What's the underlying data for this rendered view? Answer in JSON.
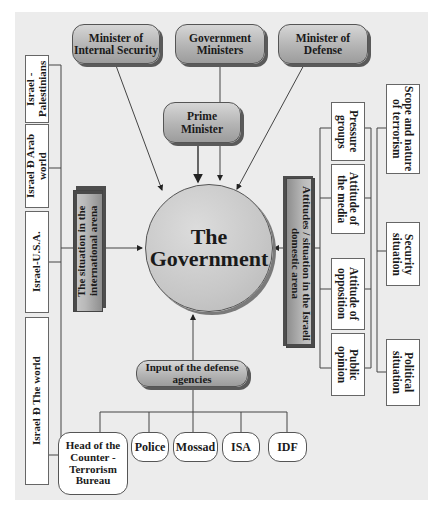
{
  "diagram": {
    "center": {
      "line1": "The",
      "line2": "Government"
    },
    "top": {
      "internal_security": "Minister of Internal Security",
      "government_ministers": "Government Ministers",
      "defense": "Minister of Defense",
      "prime_minister": "Prime Minister"
    },
    "left": {
      "arena": "The situation in the international arena",
      "relations": [
        "Israel - Palestinians",
        "Israel Ð Arab world",
        "Israel-U.S.A.",
        "Israel Ð The world"
      ]
    },
    "right": {
      "arena": "Attitudes / situation in the Israeli domestic arena",
      "inner": [
        "Pressure groups",
        "Attitude of the media",
        "Attitude of opposition",
        "Public opinion"
      ],
      "outer": [
        "Scope and nature of terrorism",
        "Security situation",
        "Political situation"
      ]
    },
    "bottom": {
      "input": "Input of the defense agencies",
      "agencies": [
        "Head of the Counter - Terrorism Bureau",
        "Police",
        "Mossad",
        "ISA",
        "IDF"
      ]
    }
  },
  "colors": {
    "background": "#ececec",
    "pill_fill": "#b4b4b4",
    "line": "#555555"
  }
}
